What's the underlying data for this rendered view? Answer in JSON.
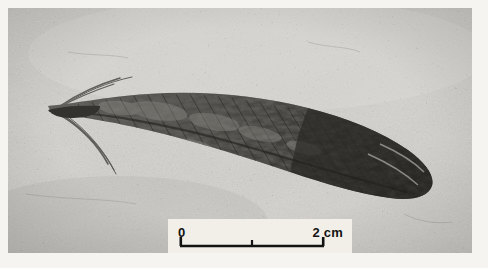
{
  "figure": {
    "domain": "photograph",
    "view": "grayscale halftone photographic plate",
    "page_background_color": "#f6f4f0",
    "plate": {
      "left": 8,
      "top": 8,
      "width": 464,
      "height": 245,
      "matrix_color": "#c9c7c3",
      "matrix_color_dark": "#a9a7a3",
      "matrix_color_light": "#dedcd8",
      "fossil_color_dark": "#262624",
      "fossil_color_mid": "#4e4d49",
      "fossil_color_light": "#7d7b76"
    },
    "specimen": {
      "name": "feather-fossil",
      "orientation": "quill at left, vane tip at right",
      "quill_tip_x": 42,
      "vane_tip_x": 432,
      "axis_y_left": 104,
      "axis_y_right": 160,
      "barb_filament_count": 6
    }
  },
  "scale_bar": {
    "name": "scale-bar",
    "box": {
      "left": 160,
      "top": 211,
      "width": 184,
      "height": 36,
      "background_color": "#f2efe9"
    },
    "rule_color": "#131313",
    "start_label": "0",
    "end_label": "2 cm",
    "unit": "cm",
    "span_value": 2,
    "ticks": [
      {
        "label": "0",
        "value": 0,
        "x": 12
      },
      {
        "label": "",
        "value": 1,
        "x": 84
      },
      {
        "label": "2 cm",
        "value": 2,
        "x": 156
      }
    ],
    "baseline_y": 27,
    "cap_height": 9,
    "mid_tick_height": 6
  }
}
